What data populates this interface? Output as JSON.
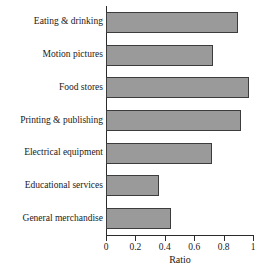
{
  "chart_data": {
    "type": "bar",
    "orientation": "horizontal",
    "title": "",
    "xlabel": "Ratio",
    "ylabel": "",
    "xlim": [
      0,
      1
    ],
    "xticks": [
      "0",
      "0.2",
      "0.4",
      "0.6",
      "0.8",
      "1"
    ],
    "xtick_values": [
      0,
      0.2,
      0.4,
      0.6,
      0.8,
      1
    ],
    "grid": false,
    "legend": false,
    "categories": [
      "Eating & drinking",
      "Motion pictures",
      "Food stores",
      "Printing & publishing",
      "Electrical equipment",
      "Educational services",
      "General merchandise"
    ],
    "values": [
      0.9,
      0.73,
      0.97,
      0.92,
      0.72,
      0.36,
      0.44
    ],
    "bar_fill_color": "#9a9a9a",
    "bar_edge_color": "#3c3c3c",
    "axis_color": "#2b2b2b"
  }
}
